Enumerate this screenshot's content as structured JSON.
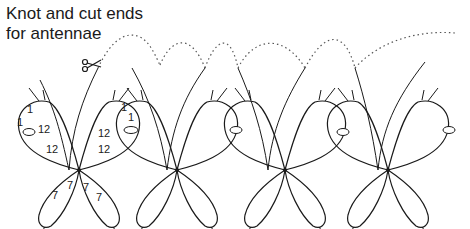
{
  "caption": {
    "line1": "Knot and cut ends",
    "line2": "for antennae"
  },
  "icons": {
    "cut": "scissors-icon"
  },
  "colors": {
    "ink": "#1a1a1a",
    "background": "#ffffff"
  },
  "butterflies": [
    {
      "index": 1,
      "annotated": true
    },
    {
      "index": 2,
      "annotated": false
    },
    {
      "index": 3,
      "annotated": false
    },
    {
      "index": 4,
      "annotated": false
    }
  ],
  "labels": {
    "upper_wing_left_a": "12",
    "upper_wing_left_b": "12",
    "upper_wing_right_a": "12",
    "upper_wing_right_b": "12",
    "lower_wing_left_a": "7",
    "lower_wing_left_b": "7",
    "lower_wing_right_a": "7",
    "lower_wing_right_b": "7",
    "picot_left_a": "1",
    "picot_left_b": "1",
    "picot_right_a": "1",
    "picot_right_b": "1"
  }
}
